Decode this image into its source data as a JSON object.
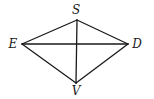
{
  "diagram": {
    "type": "geometry",
    "stroke_color": "#1a1a1a",
    "background_color": "#ffffff",
    "points": {
      "S": {
        "label": "S",
        "x": 77,
        "y": 20,
        "label_x": 76,
        "label_y": 14
      },
      "E": {
        "label": "E",
        "x": 22,
        "y": 44,
        "label_x": 13,
        "label_y": 48
      },
      "D": {
        "label": "D",
        "x": 128,
        "y": 44,
        "label_x": 137,
        "label_y": 48
      },
      "V": {
        "label": "V",
        "x": 76,
        "y": 83,
        "label_x": 76,
        "label_y": 95
      }
    },
    "segments": [
      {
        "from": "S",
        "to": "E",
        "name": "SE"
      },
      {
        "from": "S",
        "to": "D",
        "name": "SD"
      },
      {
        "from": "E",
        "to": "V",
        "name": "EV"
      },
      {
        "from": "D",
        "to": "V",
        "name": "DV"
      },
      {
        "from": "E",
        "to": "D",
        "name": "ED",
        "kind": "diagonal"
      },
      {
        "from": "S",
        "to": "V",
        "name": "SV",
        "kind": "diagonal"
      }
    ],
    "labels": {
      "S": "S",
      "E": "E",
      "D": "D",
      "V": "V"
    }
  }
}
